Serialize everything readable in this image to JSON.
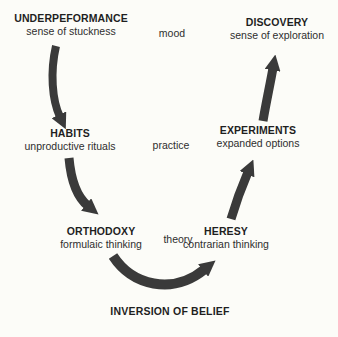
{
  "diagram": {
    "colors": {
      "background": "#fcfcf8",
      "text": "#1f1f1f",
      "arrow": "#3a3a3a"
    },
    "nodes": [
      {
        "id": "underperformance",
        "title": "UNDERPEFORMANCE",
        "subtitle": "sense of stuckness"
      },
      {
        "id": "discovery",
        "title": "DISCOVERY",
        "subtitle": "sense of exploration"
      },
      {
        "id": "habits",
        "title": "HABITS",
        "subtitle": "unproductive rituals"
      },
      {
        "id": "experiments",
        "title": "EXPERIMENTS",
        "subtitle": "expanded options"
      },
      {
        "id": "orthodoxy",
        "title": "ORTHODOXY",
        "subtitle": "formulaic thinking"
      },
      {
        "id": "heresy",
        "title": "HERESY",
        "subtitle": "contrarian thinking"
      }
    ],
    "center_labels": [
      "mood",
      "practice",
      "theory"
    ],
    "bottom_label": "INVERSION OF BELIEF",
    "flow": [
      "underperformance -> habits",
      "habits -> orthodoxy",
      "orthodoxy -> heresy (inversion of belief)",
      "heresy -> experiments",
      "experiments -> discovery"
    ]
  }
}
